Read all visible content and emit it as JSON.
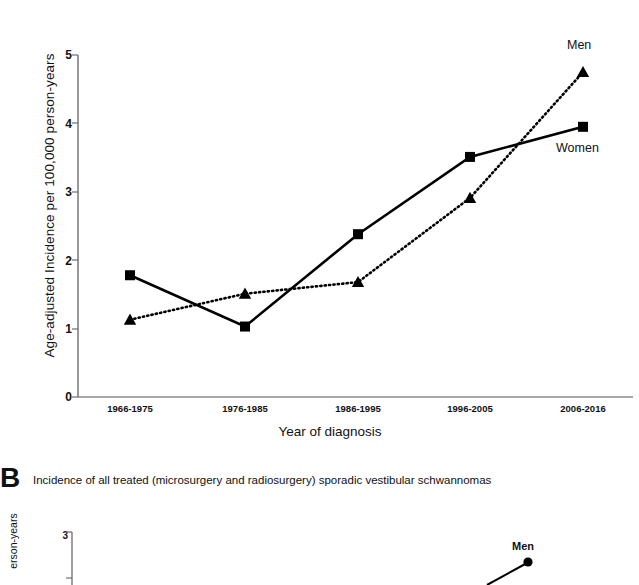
{
  "figure": {
    "panel_a": {
      "ylabel": "Age-adjusted Incidence per 100,000 person-years",
      "xlabel": "Year of diagnosis",
      "men_label": "Men",
      "women_label": "Women",
      "yticks": [
        "0",
        "1",
        "2",
        "3",
        "4",
        "5"
      ],
      "xticks": [
        "1966-1975",
        "1976-1985",
        "1986-1995",
        "1996-2005",
        "2006-2016"
      ]
    },
    "panel_b": {
      "letter": "B",
      "caption": "Incidence of all treated (microsurgery and radiosurgery) sporadic vestibular schwannomas",
      "ylabel": "erson-years",
      "ytick": "3",
      "men_label": "Men"
    }
  },
  "chart_data": {
    "type": "line",
    "title": "",
    "subtitle": "",
    "xlabel": "Year of diagnosis",
    "ylabel": "Age-adjusted Incidence per 100,000 person-years",
    "categories": [
      "1966-1975",
      "1976-1985",
      "1986-1995",
      "1996-2005",
      "2006-2016"
    ],
    "series": [
      {
        "name": "Women",
        "values": [
          1.78,
          1.03,
          2.38,
          3.51,
          3.95
        ],
        "marker": "square",
        "linestyle": "solid",
        "color": "#000000"
      },
      {
        "name": "Men",
        "values": [
          1.13,
          1.51,
          1.68,
          2.91,
          4.75
        ],
        "marker": "triangle",
        "linestyle": "dotted",
        "color": "#000000"
      }
    ],
    "ylim": [
      0,
      5
    ],
    "ytick_values": [
      0,
      1,
      2,
      3,
      4,
      5
    ],
    "grid": false,
    "legend": "inline-labels-at-series-ends",
    "legend_position": "right"
  }
}
